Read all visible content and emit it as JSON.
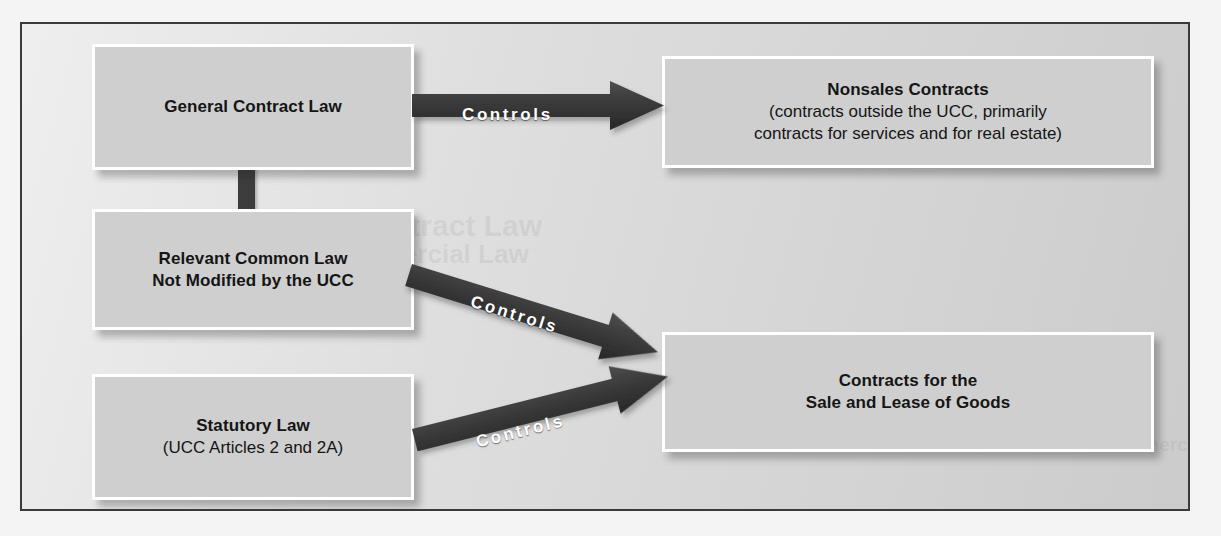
{
  "diagram": {
    "colors": {
      "frame_border": "#3a3a3a",
      "frame_background": "#dcdcdc",
      "box_fill": "#cfcfcf",
      "box_border": "#ffffff",
      "arrow_fill": "#3d3d3d",
      "arrow_label_color": "#ffffff",
      "text_color": "#151515"
    },
    "boxes": [
      {
        "id": "general-contract-law",
        "line1": "General Contract Law",
        "line2": ""
      },
      {
        "id": "relevant-common-law",
        "line1": "Relevant Common Law",
        "line2": "Not Modified by the UCC",
        "line2_bold": true
      },
      {
        "id": "statutory-law",
        "line1": "Statutory Law",
        "line2": "(UCC Articles 2 and 2A)"
      },
      {
        "id": "nonsales-contracts",
        "line1": "Nonsales Contracts",
        "line2": "(contracts outside the UCC, primarily",
        "line3": "contracts for services and for real estate)"
      },
      {
        "id": "contracts-sale-lease-goods",
        "line1": "Contracts for the",
        "line2": "Sale and Lease of Goods",
        "line2_bold": true
      }
    ],
    "arrows": [
      {
        "id": "arrow-general-to-nonsales",
        "label": "Controls",
        "from": "general-contract-law",
        "to": "nonsales-contracts",
        "direction": "horizontal"
      },
      {
        "id": "arrow-common-to-goods",
        "label": "Controls",
        "from": "relevant-common-law",
        "to": "contracts-sale-lease-goods",
        "direction": "down-right"
      },
      {
        "id": "arrow-statutory-to-goods",
        "label": "Controls",
        "from": "statutory-law",
        "to": "contracts-sale-lease-goods",
        "direction": "up-right"
      }
    ],
    "connector": {
      "id": "connector-general-to-common",
      "from": "general-contract-law",
      "to": "relevant-common-law"
    },
    "ghost_text": [
      "Contract Law",
      "Commercial Law",
      "Uniform Commercial Code"
    ]
  }
}
